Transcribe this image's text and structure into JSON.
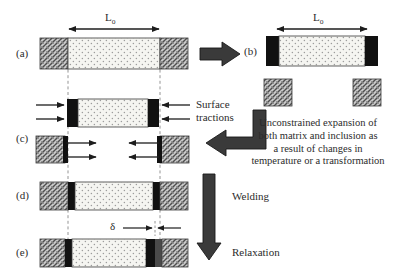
{
  "figure": {
    "type": "schematic-diagram",
    "background": "#ffffff"
  },
  "panels": [
    {
      "id": "a",
      "label": "(a)",
      "caption": "matrix with embedded inclusion, original length"
    },
    {
      "id": "b",
      "label": "(b)",
      "caption": "inclusion removed and freely expanded; matrix hole expanded"
    },
    {
      "id": "c",
      "label": "(c)",
      "caption": "surface tractions applied to restore original shape"
    },
    {
      "id": "d",
      "label": "(d)",
      "caption": "welded back together"
    },
    {
      "id": "e",
      "label": "(e)",
      "caption": "relaxed, showing misfit delta"
    }
  ],
  "dimension_labels": {
    "L_top_left": {
      "symbol": "L",
      "subscript": "o"
    },
    "L_top_right": {
      "symbol": "L",
      "subscript": "o"
    },
    "misfit": {
      "symbol": "δ"
    }
  },
  "annotations": {
    "surface_tractions": {
      "line1": "Surface",
      "line2": "tractions"
    },
    "unconstrained_expansion": {
      "line1": "Unconstrained expansion of",
      "line2": "both matrix and inclusion as",
      "line3": "a result of changes in",
      "line4": "temperature or a transformation"
    },
    "welding": "Welding",
    "relaxation": "Relaxation"
  },
  "arrows": {
    "a_to_b": {
      "name": "block-arrow-right",
      "direction": "right"
    },
    "text_to_c": {
      "name": "curved-elbow-arrow-left",
      "direction": "left"
    },
    "d_to_e": {
      "name": "block-arrow-down",
      "direction": "down"
    },
    "traction_inclusion": {
      "direction": "inward",
      "count": 4
    },
    "traction_matrix": {
      "direction": "outward",
      "count": 4
    }
  },
  "colors": {
    "matrix_hatch_base": "#c9c9c9",
    "matrix_hatch_line": "#555555",
    "inclusion_fill": "#f4f4f0",
    "inclusion_dot": "#9a9a9a",
    "interface_black": "#111111",
    "interface_gray": "#4a4a4a",
    "outline": "#3a3a3a",
    "arrow_fill": "#2c2c2c",
    "guide_dash": "#777777",
    "text": "#2b2b2b"
  },
  "geometry": {
    "panel_a": {
      "x": 48,
      "y": 38,
      "w": 150,
      "h": 31,
      "matrix_left_w": 28,
      "matrix_right_w": 28
    },
    "panel_b": {
      "x": 266,
      "y": 36,
      "w": 112,
      "h": 30,
      "cap_w": 13
    },
    "panel_b_blocks": {
      "left_x": 264,
      "right_x": 355,
      "y": 79,
      "w": 28,
      "h": 26
    },
    "panel_c_inclusion": {
      "x": 67,
      "y": 99,
      "w": 92,
      "h": 28,
      "cap_w": 11
    },
    "panel_c_blocks": {
      "left_x": 36,
      "right_x": 160,
      "y": 136,
      "w": 29,
      "h": 27
    },
    "panel_d": {
      "x": 40,
      "y": 182,
      "w": 148,
      "h": 28
    },
    "panel_e": {
      "x": 40,
      "y": 239,
      "w": 148,
      "h": 28
    },
    "guides": {
      "left_x": 68,
      "right_x": 160,
      "top": 62,
      "bottom": 248
    }
  }
}
